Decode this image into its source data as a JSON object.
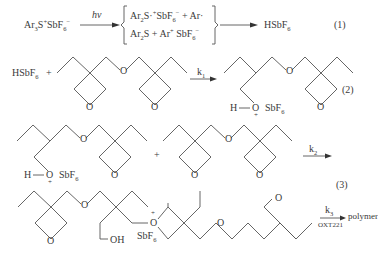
{
  "equations": {
    "eq1": {
      "reactant": "Ar3S+SbF6−",
      "reactant_parts": {
        "a": "Ar",
        "b": "3",
        "c": "S",
        "d": "+",
        "e": "SbF",
        "f": "6",
        "g": "−"
      },
      "arrow_label": "hν",
      "intermediate_line1": {
        "a": "Ar",
        "b": "2",
        "c": "S·",
        "d": "+",
        "e": "SbF",
        "f": "6",
        "g": "−",
        "h": " + Ar·"
      },
      "intermediate_line2": {
        "a": "Ar",
        "b": "2",
        "c": "S + Ar",
        "d": "+",
        "e": " SbF",
        "f": "6",
        "g": "−"
      },
      "product": {
        "a": "HSbF",
        "b": "6"
      },
      "number": "(1)"
    },
    "eq2": {
      "reactant": {
        "a": "HSbF",
        "b": "6"
      },
      "plus": "+",
      "arrow_label": "k",
      "arrow_sub": "1",
      "product_labels": {
        "h": "H",
        "o": "O",
        "plus": "+",
        "sbf": "SbF",
        "six": "6",
        "oxygen": "O"
      },
      "number": "(2)"
    },
    "eq3": {
      "plus": "+",
      "arrow_label": "k",
      "arrow_sub": "2",
      "number": "(3)",
      "product_labels": {
        "oh": "OH",
        "sbf": "SbF",
        "six": "6",
        "o_plus": "+"
      },
      "final_arrow_label": "k",
      "final_arrow_sub": "3",
      "final_arrow_below": "OXT221",
      "final_product": "polymer"
    },
    "atoms": {
      "O": "O"
    }
  }
}
